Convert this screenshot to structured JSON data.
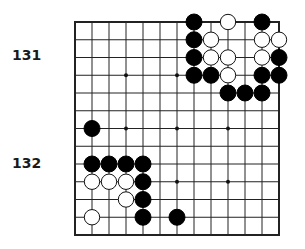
{
  "labels": [
    {
      "text": "131",
      "x": 12,
      "y": 48
    },
    {
      "text": "132",
      "x": 12,
      "y": 156
    }
  ],
  "board": {
    "origin_x": 75,
    "origin_y": 22,
    "cols": 13,
    "rows": 13,
    "dx": 17,
    "dy": 17.75,
    "stone_radius": 8,
    "line_color": "#222222",
    "border_width": 2,
    "star_points": [
      [
        3,
        3
      ],
      [
        6,
        3
      ],
      [
        3,
        6
      ],
      [
        6,
        6
      ],
      [
        9,
        6
      ],
      [
        6,
        9
      ],
      [
        9,
        9
      ]
    ],
    "black_stones": [
      [
        7,
        0
      ],
      [
        11,
        0
      ],
      [
        7,
        1
      ],
      [
        7,
        2
      ],
      [
        12,
        2
      ],
      [
        7,
        3
      ],
      [
        8,
        3
      ],
      [
        11,
        3
      ],
      [
        12,
        3
      ],
      [
        9,
        4
      ],
      [
        10,
        4
      ],
      [
        11,
        4
      ],
      [
        1,
        6
      ],
      [
        1,
        8
      ],
      [
        2,
        8
      ],
      [
        3,
        8
      ],
      [
        4,
        8
      ],
      [
        4,
        9
      ],
      [
        4,
        10
      ],
      [
        4,
        11
      ],
      [
        6,
        11
      ]
    ],
    "white_stones": [
      [
        9,
        0
      ],
      [
        8,
        1
      ],
      [
        11,
        1
      ],
      [
        12,
        1
      ],
      [
        8,
        2
      ],
      [
        9,
        2
      ],
      [
        11,
        2
      ],
      [
        9,
        3
      ],
      [
        1,
        9
      ],
      [
        2,
        9
      ],
      [
        3,
        9
      ],
      [
        3,
        10
      ],
      [
        1,
        11
      ]
    ]
  }
}
